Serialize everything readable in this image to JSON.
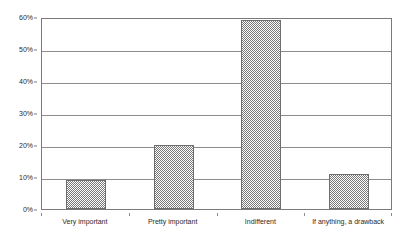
{
  "chart_data": {
    "type": "bar",
    "title": "",
    "xlabel": "",
    "ylabel": "",
    "categories": [
      "Very important",
      "Pretty important",
      "Indifferent",
      "If anything, a drawback"
    ],
    "values": [
      9.1,
      20.0,
      59.0,
      10.9
    ],
    "ylim": [
      0,
      60
    ],
    "ytick_values": [
      0,
      10,
      20,
      30,
      40,
      50,
      60
    ],
    "ytick_labels": [
      "0%",
      "10%",
      "20%",
      "30%",
      "40%",
      "50%",
      "60%"
    ],
    "grid": true,
    "legend": false,
    "series": [
      {
        "name": "Share of respondents",
        "values": [
          9.1,
          20.0,
          59.0,
          10.9
        ]
      }
    ],
    "colors": {
      "bar_fill": "#777777",
      "bar_border": "#6e6e6e",
      "gridline": "#8c8c8c",
      "plot_border": "#7a7a7a",
      "background": "#ffffff",
      "text": "#2b2b2b"
    }
  }
}
